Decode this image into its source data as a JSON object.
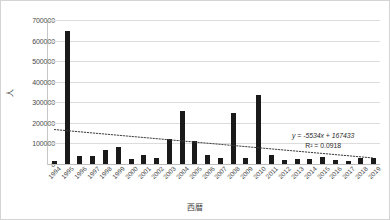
{
  "chart_data": {
    "type": "bar",
    "title": "",
    "xlabel": "西暦",
    "ylabel": "人",
    "ylim": [
      0,
      700000
    ],
    "ytick_step": 100000,
    "yticks": [
      "0",
      "100000",
      "200000",
      "300000",
      "400000",
      "500000",
      "600000",
      "700000"
    ],
    "grid": true,
    "legend": "none",
    "bar_color": "#1a1a1a",
    "categories": [
      "1994",
      "1995",
      "1996",
      "1997",
      "1998",
      "1999",
      "2000",
      "2001",
      "2002",
      "2003",
      "2004",
      "2005",
      "2006",
      "2007",
      "2008",
      "2009",
      "2010",
      "2011",
      "2012",
      "2013",
      "2014",
      "2015",
      "2016",
      "2017",
      "2018",
      "2019"
    ],
    "values": [
      17000,
      645000,
      38000,
      37000,
      70000,
      85000,
      25000,
      45000,
      30000,
      120000,
      258000,
      110000,
      45000,
      28000,
      250000,
      27000,
      335000,
      45000,
      20000,
      22000,
      25000,
      32000,
      18000,
      17000,
      27000,
      30000
    ],
    "series": [
      {
        "name": "人",
        "values": [
          17000,
          645000,
          38000,
          37000,
          70000,
          85000,
          25000,
          45000,
          30000,
          120000,
          258000,
          110000,
          45000,
          28000,
          250000,
          27000,
          335000,
          45000,
          20000,
          22000,
          25000,
          32000,
          18000,
          17000,
          27000,
          30000
        ]
      }
    ],
    "trendline": {
      "type": "linear",
      "style": "dotted",
      "color": "#3d3d3d",
      "equation": "y = -5534x + 167433",
      "r_squared": "R² = 0.0918",
      "slope": -5534,
      "intercept": 167433,
      "y_start": 167433,
      "y_end": 29083
    }
  }
}
